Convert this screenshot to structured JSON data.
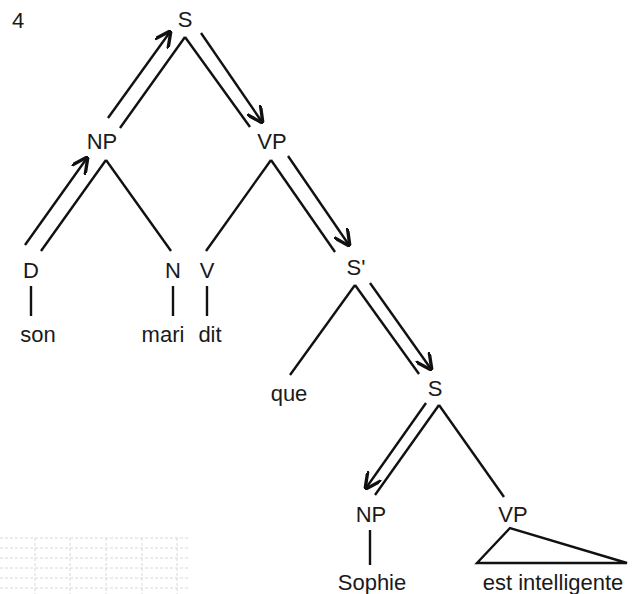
{
  "figure": {
    "number": "4",
    "colors": {
      "ink": "#111111",
      "grid": "#d8d8d8"
    }
  },
  "tree": {
    "nodes": {
      "S_root": "S",
      "NP1": "NP",
      "VP1": "VP",
      "D": "D",
      "N": "N",
      "V": "V",
      "S_bar": "S'",
      "S2": "S",
      "NP2": "NP",
      "VP2": "VP"
    },
    "leaves": {
      "son": "son",
      "mari": "mari",
      "dit": "dit",
      "que": "que",
      "Sophie": "Sophie",
      "est_intelligente": "est intelligente"
    },
    "path_arrows": [
      "D → NP",
      "NP → S",
      "S → VP",
      "VP → S'",
      "S' → S",
      "S → NP"
    ]
  }
}
